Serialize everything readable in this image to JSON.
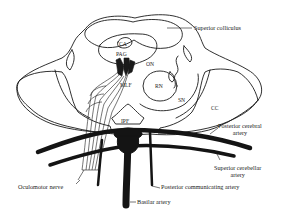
{
  "diagram": {
    "colors": {
      "outline": "#1a1a1a",
      "vessel": "#141414",
      "background": "#ffffff",
      "text": "#222222"
    },
    "labels": {
      "superior_colliculus": "Superior colliculus",
      "ca": "CA",
      "pag": "PAG",
      "on": "ON",
      "mlf": "MLF",
      "rn": "RN",
      "sn": "SN",
      "cc": "CC",
      "ipf": "IPF",
      "posterior_cerebral_line1": "Posterior cerebral",
      "posterior_cerebral_line2": "artery",
      "superior_cerebellar_line1": "Superior cerebellar",
      "superior_cerebellar_line2": "artery",
      "posterior_communicating": "Posterior communicating artery",
      "oculomotor_nerve": "Oculomotor nerve",
      "basilar_artery": "Basilar artery"
    }
  }
}
